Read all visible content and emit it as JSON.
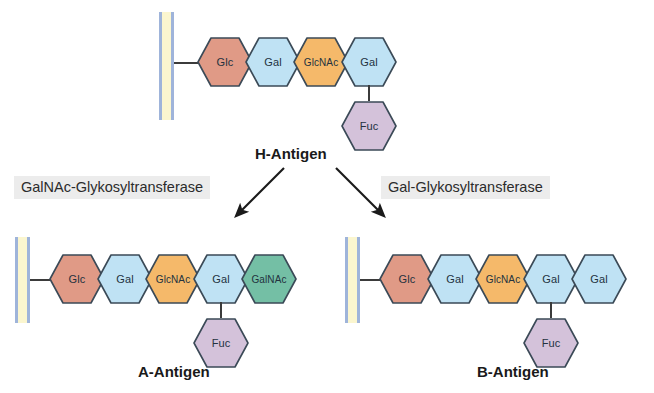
{
  "figure": {
    "background": "#ffffff"
  },
  "palette": {
    "glc": "#e09a86",
    "gal": "#bfe2f4",
    "glcnac": "#f5b96a",
    "fuc": "#d4c2da",
    "galnac": "#74bfa5",
    "outline": "#3b4a57",
    "membrane_line": "#9fb4da",
    "membrane_fill": "#fbf6cf",
    "enzyme_bg": "#ececec",
    "text": "#1a1a1a"
  },
  "h_antigen": {
    "label": "H-Antigen",
    "chain": [
      {
        "label": "Glc",
        "color_key": "glc"
      },
      {
        "label": "Gal",
        "color_key": "gal"
      },
      {
        "label": "GlcNAc",
        "color_key": "glcnac"
      },
      {
        "label": "Gal",
        "color_key": "gal"
      }
    ],
    "branch": {
      "label": "Fuc",
      "color_key": "fuc",
      "attached_to": "Gal"
    }
  },
  "enzymes": {
    "left": {
      "label": "GalNAc-Glykosyltransferase"
    },
    "right": {
      "label": "Gal-Glykosyltransferase"
    }
  },
  "a_antigen": {
    "label": "A-Antigen",
    "chain": [
      {
        "label": "Glc",
        "color_key": "glc"
      },
      {
        "label": "Gal",
        "color_key": "gal"
      },
      {
        "label": "GlcNAc",
        "color_key": "glcnac"
      },
      {
        "label": "Gal",
        "color_key": "gal"
      },
      {
        "label": "GalNAc",
        "color_key": "galnac"
      }
    ],
    "branch": {
      "label": "Fuc",
      "color_key": "fuc",
      "attached_to": "Gal"
    }
  },
  "b_antigen": {
    "label": "B-Antigen",
    "chain": [
      {
        "label": "Glc",
        "color_key": "glc"
      },
      {
        "label": "Gal",
        "color_key": "gal"
      },
      {
        "label": "GlcNAc",
        "color_key": "glcnac"
      },
      {
        "label": "Gal",
        "color_key": "gal"
      },
      {
        "label": "Gal",
        "color_key": "gal"
      }
    ],
    "branch": {
      "label": "Fuc",
      "color_key": "fuc",
      "attached_to": "Gal"
    }
  }
}
